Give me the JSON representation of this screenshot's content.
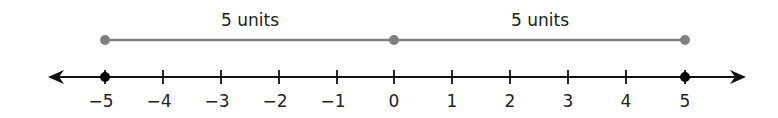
{
  "diagram": {
    "type": "number_line",
    "range": [
      -5,
      5
    ],
    "tick_labels": [
      "−5",
      "−4",
      "−3",
      "−2",
      "−1",
      "0",
      "1",
      "2",
      "3",
      "4",
      "5"
    ],
    "marked_points": [
      -5,
      5
    ],
    "segments": [
      {
        "from": -5,
        "to": 0,
        "label": "5 units"
      },
      {
        "from": 0,
        "to": 5,
        "label": "5 units"
      }
    ],
    "colors": {
      "axis": "#111111",
      "segment": "#808080",
      "point": "#000000"
    }
  }
}
